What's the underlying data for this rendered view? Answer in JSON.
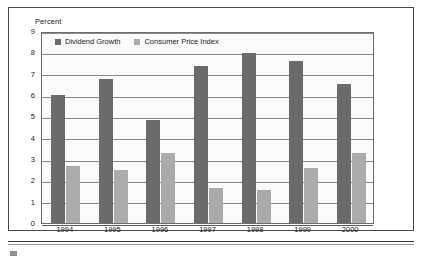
{
  "figure": {
    "axis_unit_label": "Percent"
  },
  "legend": {
    "entries": [
      {
        "label": "Dividend Growth",
        "color": "#6b6b6b"
      },
      {
        "label": "Consumer Price Index",
        "color": "#ababab"
      }
    ]
  },
  "chart_data": {
    "type": "bar",
    "title": "",
    "subtitle": "",
    "xlabel": "",
    "ylabel": "Percent",
    "ylim": [
      0,
      9
    ],
    "ytick_labels": [
      "0",
      "1",
      "2",
      "3",
      "4",
      "5",
      "6",
      "7",
      "8",
      "9"
    ],
    "yticks": [
      0,
      1,
      2,
      3,
      4,
      5,
      6,
      7,
      8,
      9
    ],
    "grid": true,
    "grid_axis": "y",
    "legend_position": "top-left-inside",
    "categories": [
      "1994",
      "1995",
      "1996",
      "1997",
      "1998",
      "1999",
      "2000"
    ],
    "series": [
      {
        "name": "Dividend Growth",
        "color": "#6b6b6b",
        "values": [
          6.0,
          6.75,
          4.85,
          7.35,
          7.95,
          7.6,
          6.5
        ]
      },
      {
        "name": "Consumer Price Index",
        "color": "#ababab",
        "values": [
          2.65,
          2.5,
          3.3,
          1.65,
          1.55,
          2.6,
          3.3
        ]
      }
    ]
  }
}
